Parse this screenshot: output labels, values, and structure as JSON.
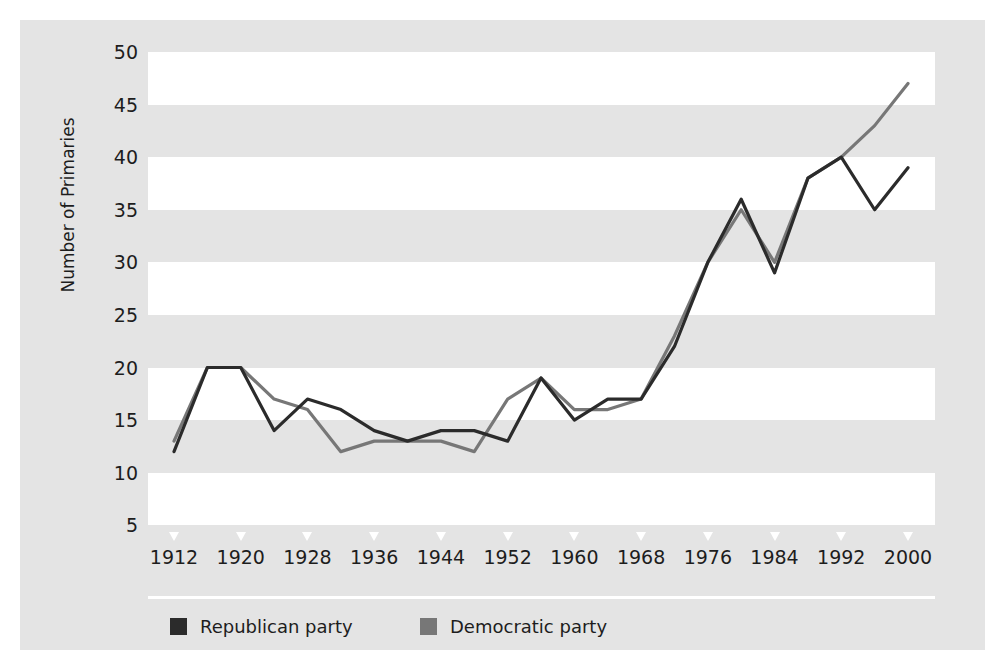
{
  "chart_data": {
    "type": "line",
    "title": "",
    "xlabel": "",
    "ylabel": "Number of Primaries",
    "xlim": [
      1912,
      2000
    ],
    "ylim": [
      0,
      52
    ],
    "ytick_values": [
      50,
      45,
      40,
      35,
      30,
      25,
      20,
      15,
      10,
      5
    ],
    "ytick_labels": [
      "50",
      "45",
      "40",
      "35",
      "30",
      "25",
      "20",
      "15",
      "10",
      "5"
    ],
    "xtick_values": [
      1912,
      1920,
      1928,
      1936,
      1944,
      1952,
      1960,
      1968,
      1976,
      1984,
      1992,
      2000
    ],
    "xtick_labels": [
      "1912",
      "1920",
      "1928",
      "1936",
      "1944",
      "1952",
      "1960",
      "1968",
      "1976",
      "1984",
      "1992",
      "2000"
    ],
    "grid": "horizontal-alternating-bands",
    "legend_position": "below-axes",
    "x": [
      1912,
      1916,
      1920,
      1924,
      1928,
      1932,
      1936,
      1940,
      1944,
      1948,
      1952,
      1956,
      1960,
      1964,
      1968,
      1972,
      1976,
      1980,
      1984,
      1988,
      1992,
      1996,
      2000
    ],
    "series": [
      {
        "name": "Republican party",
        "color": "#2b2b2b",
        "values": [
          12,
          20,
          20,
          14,
          17,
          16,
          14,
          13,
          14,
          14,
          13,
          19,
          15,
          17,
          17,
          22,
          30,
          36,
          29,
          38,
          40,
          35,
          39
        ]
      },
      {
        "name": "Democratic party",
        "color": "#777777",
        "values": [
          13,
          20,
          20,
          17,
          16,
          12,
          13,
          13,
          13,
          12,
          17,
          19,
          16,
          16,
          17,
          23,
          30,
          35,
          30,
          38,
          40,
          43,
          47
        ]
      }
    ]
  },
  "axes": {
    "ylabel": "Number of Primaries"
  },
  "legend": {
    "items": [
      {
        "label": "Republican party",
        "color": "#2b2b2b",
        "left": 22
      },
      {
        "label": "Democratic party",
        "color": "#777777",
        "left": 272
      }
    ]
  },
  "colors": {
    "figure_background": "#e4e4e4",
    "band_light": "#ffffff",
    "band_dark": "#e4e4e4",
    "page_border": "#ffffff",
    "text": "#1d1d1d"
  }
}
